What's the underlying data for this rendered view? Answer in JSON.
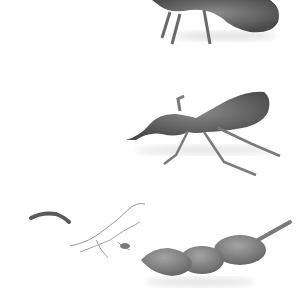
{
  "image": {
    "description": "Grayscale photo of tamarind pods on a white background",
    "subjects": [
      {
        "name": "top-pod",
        "description": "Tamarind pod with fibrous legs, partially cropped at top"
      },
      {
        "name": "middle-pod",
        "description": "Elongated curved tamarind pod with stringy fibers"
      },
      {
        "name": "bottom-pods",
        "description": "Three-segment tamarind pod with stem, loose fibers and small twig to the left"
      }
    ],
    "colors": {
      "background": "#ffffff",
      "pod": "#6e6e6e",
      "pod_dark": "#4a4a4a",
      "fiber": "#7a7a7a",
      "shadow": "#e4e4e4"
    }
  }
}
